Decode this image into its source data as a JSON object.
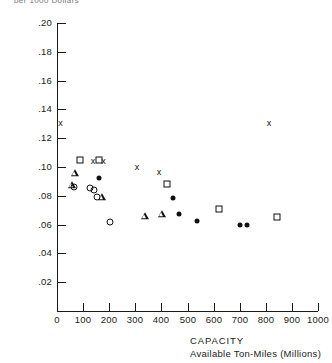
{
  "figure": {
    "top_caption": "per 1000 Dollars"
  },
  "chart_data": {
    "type": "scatter",
    "title": "",
    "xlabel": "CAPACITY",
    "xlabel_line2": "Available Ton-Miles (Millions)",
    "ylabel": "",
    "xlim": [
      0,
      1000
    ],
    "ylim": [
      0.0,
      0.2
    ],
    "grid": false,
    "legend": "none",
    "xticks": [
      0,
      100,
      200,
      300,
      400,
      500,
      600,
      700,
      800,
      900,
      1000
    ],
    "xticklabels": [
      "0",
      "100",
      "200",
      "300",
      "400",
      "500",
      "600",
      "700",
      "800",
      "900",
      "1000"
    ],
    "yticks": [
      0.02,
      0.04,
      0.06,
      0.08,
      0.1,
      0.12,
      0.14,
      0.16,
      0.18,
      0.2
    ],
    "yticklabels": [
      ".02",
      ".04",
      ".06",
      ".08",
      ".10",
      ".12",
      ".14",
      ".16",
      ".18",
      ".20"
    ],
    "series": [
      {
        "name": "cross",
        "marker": "x",
        "points": [
          {
            "x": 13,
            "y": 0.1305
          },
          {
            "x": 138,
            "y": 0.1041
          },
          {
            "x": 178,
            "y": 0.1041
          },
          {
            "x": 306,
            "y": 0.1
          },
          {
            "x": 391,
            "y": 0.0965
          },
          {
            "x": 812,
            "y": 0.1305
          }
        ]
      },
      {
        "name": "square",
        "marker": "s",
        "points": [
          {
            "x": 88,
            "y": 0.1049
          },
          {
            "x": 161,
            "y": 0.1049
          },
          {
            "x": 421,
            "y": 0.0882
          },
          {
            "x": 620,
            "y": 0.0708
          },
          {
            "x": 843,
            "y": 0.0653
          }
        ]
      },
      {
        "name": "triangle",
        "marker": "^",
        "points": [
          {
            "x": 69,
            "y": 0.0958
          },
          {
            "x": 57,
            "y": 0.0875
          },
          {
            "x": 172,
            "y": 0.0792
          },
          {
            "x": 337,
            "y": 0.066
          },
          {
            "x": 402,
            "y": 0.0674
          }
        ]
      },
      {
        "name": "open-circle",
        "marker": "o",
        "points": [
          {
            "x": 65,
            "y": 0.0861
          },
          {
            "x": 126,
            "y": 0.0854
          },
          {
            "x": 142,
            "y": 0.084
          },
          {
            "x": 153,
            "y": 0.0792
          },
          {
            "x": 203,
            "y": 0.0618
          }
        ]
      },
      {
        "name": "filled-circle",
        "marker": ".",
        "points": [
          {
            "x": 160,
            "y": 0.0924
          },
          {
            "x": 444,
            "y": 0.0785
          },
          {
            "x": 467,
            "y": 0.0674
          },
          {
            "x": 536,
            "y": 0.0625
          },
          {
            "x": 701,
            "y": 0.0597
          },
          {
            "x": 728,
            "y": 0.0597
          }
        ]
      }
    ]
  }
}
